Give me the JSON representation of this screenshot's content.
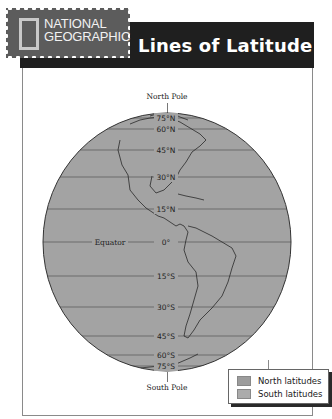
{
  "header": {
    "brand_line1": "NATIONAL",
    "brand_line2": "GEOGRAPHIC",
    "title": "Lines of Latitude",
    "logo_icon": "national-geographic-yellow-rectangle-icon"
  },
  "map": {
    "north_pole_label": "North Pole",
    "south_pole_label": "South Pole",
    "equator_label": "Equator",
    "globe_fill": "#a3a3a3",
    "line_color": "#555555",
    "latitudes": [
      {
        "label": "75°N",
        "y": 118,
        "hemisphere": "north"
      },
      {
        "label": "60°N",
        "y": 129,
        "hemisphere": "north"
      },
      {
        "label": "45°N",
        "y": 150,
        "hemisphere": "north"
      },
      {
        "label": "30°N",
        "y": 177,
        "hemisphere": "north"
      },
      {
        "label": "15°N",
        "y": 209,
        "hemisphere": "north"
      },
      {
        "label": "0°",
        "y": 242,
        "hemisphere": "equator"
      },
      {
        "label": "15°S",
        "y": 276,
        "hemisphere": "south"
      },
      {
        "label": "30°S",
        "y": 307,
        "hemisphere": "south"
      },
      {
        "label": "45°S",
        "y": 336,
        "hemisphere": "south"
      },
      {
        "label": "60°S",
        "y": 355,
        "hemisphere": "south"
      },
      {
        "label": "75°S",
        "y": 366,
        "hemisphere": "south"
      }
    ]
  },
  "legend": {
    "items": [
      {
        "label": "North latitudes",
        "color": "#9c9c9c"
      },
      {
        "label": "South latitudes",
        "color": "#ababab"
      }
    ]
  }
}
